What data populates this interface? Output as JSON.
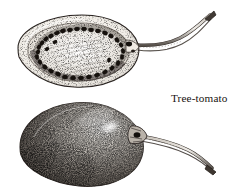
{
  "figure": {
    "title": "Tree-tomato",
    "background_color": "#ffffff",
    "ink_color": "#1d1916",
    "width": 236,
    "height": 193
  },
  "caption": {
    "label": "Tree-tomato"
  },
  "specimens": [
    {
      "id": "cross-section",
      "name": "tree-tomato-cross-section",
      "description": "Longitudinal cut fruit showing seed ring and pulp, stalk curving to upper right",
      "outline_color": "#2a2421",
      "flesh_tone": "#f2efe9",
      "seed_color": "#17120e",
      "seed_count": 34
    },
    {
      "id": "whole-fruit",
      "name": "tree-tomato-whole-fruit",
      "description": "Whole egg-shaped fruit with stippled shading, highlight on upper right, stalk curving right",
      "outline_color": "#2a2421",
      "body_tone": "#8d867e",
      "highlight_color": "#efece6"
    }
  ],
  "stems": [
    {
      "id": "upper-stem",
      "name": "cross-section-stalk",
      "tip": "cut-angled"
    },
    {
      "id": "lower-stem",
      "name": "whole-fruit-stalk",
      "tip": "cut-angled"
    }
  ]
}
